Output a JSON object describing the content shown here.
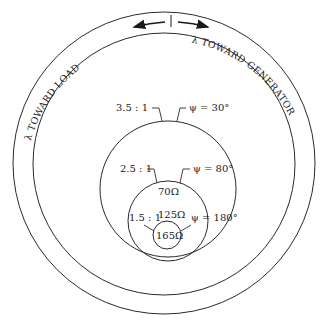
{
  "diagram": {
    "ring_labels": {
      "left": "λ TOWARD LOAD",
      "right": "λ TOWARD GENERATOR"
    },
    "colors": {
      "stroke": "#2a2a2a",
      "text": "#1a1a1a",
      "background": "#ffffff"
    },
    "circles": [
      {
        "id": "outer-ring-outer",
        "cx": 164,
        "cy": 163,
        "r": 151
      },
      {
        "id": "outer-ring-inner",
        "cx": 164,
        "cy": 164,
        "r": 131
      },
      {
        "id": "swr-3.5",
        "cx": 168,
        "cy": 189,
        "r": 68
      },
      {
        "id": "swr-2.5",
        "cx": 168,
        "cy": 221,
        "r": 41
      },
      {
        "id": "swr-1.5",
        "cx": 167,
        "cy": 235,
        "r": 15
      }
    ],
    "labels": {
      "swr_35": "3.5 : 1",
      "psi_30": "ψ = 30°",
      "swr_25": "2.5 : 1",
      "psi_80": "ψ = 80°",
      "z_70": "70Ω",
      "swr_15": "1.5 : 1",
      "z_125": "125Ω",
      "psi_180": "ψ = 180°",
      "z_165": "165Ω"
    }
  }
}
